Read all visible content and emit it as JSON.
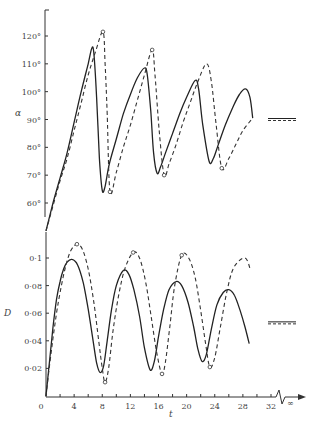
{
  "chart_data": [
    {
      "type": "line",
      "title": "",
      "xlabel": "t",
      "ylabel": "α",
      "ylim": [
        50,
        128
      ],
      "xlim": [
        0,
        32
      ],
      "yticks": [
        60,
        70,
        80,
        90,
        100,
        110,
        120
      ],
      "ytick_labels": [
        "60°",
        "70°",
        "80°",
        "90°",
        "100°",
        "110°",
        "120°"
      ],
      "grid": false,
      "asymptote": {
        "value": 90,
        "label": "t → ∞"
      },
      "series": [
        {
          "name": "solid",
          "style": "solid",
          "points": [
            [
              0,
              50
            ],
            [
              1,
              60
            ],
            [
              2,
              69
            ],
            [
              3,
              78
            ],
            [
              4,
              89
            ],
            [
              5,
              100
            ],
            [
              6,
              110
            ],
            [
              6.5,
              115.5
            ],
            [
              6.8,
              114
            ],
            [
              7.2,
              98
            ],
            [
              7.6,
              76
            ],
            [
              8,
              64.5
            ],
            [
              8.4,
              66
            ],
            [
              9,
              74
            ],
            [
              10,
              83
            ],
            [
              11,
              92
            ],
            [
              12,
              99
            ],
            [
              13,
              105
            ],
            [
              14,
              108.5
            ],
            [
              14.4,
              106
            ],
            [
              14.9,
              93
            ],
            [
              15.3,
              78
            ],
            [
              15.8,
              70.7
            ],
            [
              16.3,
              73
            ],
            [
              17,
              78
            ],
            [
              18,
              85
            ],
            [
              19,
              92
            ],
            [
              20,
              98
            ],
            [
              21.2,
              104
            ],
            [
              21.7,
              101
            ],
            [
              22.3,
              88
            ],
            [
              23.2,
              75
            ],
            [
              23.8,
              76
            ],
            [
              24.5,
              81
            ],
            [
              25.5,
              88
            ],
            [
              26.5,
              94
            ],
            [
              27.5,
              99
            ],
            [
              28.4,
              101
            ],
            [
              29,
              98
            ],
            [
              29.4,
              90.5
            ]
          ]
        },
        {
          "name": "dashed",
          "style": "dashed",
          "points": [
            [
              0,
              50
            ],
            [
              1,
              59
            ],
            [
              2,
              68
            ],
            [
              3,
              76
            ],
            [
              4,
              86
            ],
            [
              5,
              96
            ],
            [
              6,
              106
            ],
            [
              7,
              114
            ],
            [
              8.1,
              121.5
            ],
            [
              8.4,
              110
            ],
            [
              8.7,
              92
            ],
            [
              9.1,
              64
            ],
            [
              10,
              71
            ],
            [
              11,
              80
            ],
            [
              12,
              88
            ],
            [
              13,
              97
            ],
            [
              14,
              106
            ],
            [
              15.1,
              115
            ],
            [
              15.5,
              106
            ],
            [
              16.1,
              86
            ],
            [
              16.8,
              70
            ],
            [
              17.5,
              74
            ],
            [
              18.5,
              81
            ],
            [
              19.5,
              89
            ],
            [
              20.5,
              96
            ],
            [
              21.5,
              103
            ],
            [
              22.8,
              110
            ],
            [
              23.5,
              104
            ],
            [
              24.2,
              88
            ],
            [
              25,
              72.5
            ],
            [
              26,
              76
            ],
            [
              27,
              81
            ],
            [
              28,
              86
            ],
            [
              29.4,
              90.5
            ]
          ]
        }
      ],
      "markers": [
        {
          "series": "dashed",
          "t": 8.1,
          "value": 121.5
        },
        {
          "series": "dashed",
          "t": 9.1,
          "value": 64
        },
        {
          "series": "dashed",
          "t": 15.1,
          "value": 115
        },
        {
          "series": "dashed",
          "t": 16.8,
          "value": 70
        },
        {
          "series": "dashed",
          "t": 25,
          "value": 72.5
        }
      ]
    },
    {
      "type": "line",
      "title": "",
      "xlabel": "t",
      "ylabel": "D",
      "ylim": [
        0,
        0.125
      ],
      "xlim": [
        0,
        32
      ],
      "xticks": [
        0,
        4,
        8,
        12,
        16,
        20,
        24,
        28,
        32
      ],
      "xtick_labels": [
        "0",
        "4",
        "8",
        "12",
        "16",
        "20",
        "24",
        "28",
        "32"
      ],
      "x_break_label": "∞",
      "yticks": [
        0.02,
        0.04,
        0.06,
        0.08,
        0.1
      ],
      "ytick_labels": [
        "0·02",
        "0·04",
        "0·06",
        "0·08",
        "0·1"
      ],
      "grid": false,
      "asymptote": {
        "value": 0.053,
        "label": "t → ∞"
      },
      "series": [
        {
          "name": "solid",
          "style": "solid",
          "points": [
            [
              0,
              0
            ],
            [
              0.5,
              0.025
            ],
            [
              1,
              0.05
            ],
            [
              1.5,
              0.07
            ],
            [
              2,
              0.083
            ],
            [
              2.5,
              0.092
            ],
            [
              3,
              0.097
            ],
            [
              3.7,
              0.099
            ],
            [
              4.5,
              0.095
            ],
            [
              5.3,
              0.082
            ],
            [
              6,
              0.063
            ],
            [
              6.7,
              0.04
            ],
            [
              7.2,
              0.024
            ],
            [
              7.7,
              0.017
            ],
            [
              8.2,
              0.022
            ],
            [
              8.7,
              0.04
            ],
            [
              9.3,
              0.062
            ],
            [
              10,
              0.08
            ],
            [
              11,
              0.091
            ],
            [
              11.8,
              0.088
            ],
            [
              12.5,
              0.077
            ],
            [
              13.3,
              0.058
            ],
            [
              14,
              0.035
            ],
            [
              14.8,
              0.019
            ],
            [
              15.4,
              0.025
            ],
            [
              16,
              0.043
            ],
            [
              16.7,
              0.062
            ],
            [
              17.5,
              0.077
            ],
            [
              18.5,
              0.083
            ],
            [
              19.3,
              0.08
            ],
            [
              20.2,
              0.068
            ],
            [
              21,
              0.05
            ],
            [
              21.6,
              0.034
            ],
            [
              22.2,
              0.025
            ],
            [
              22.8,
              0.03
            ],
            [
              23.5,
              0.048
            ],
            [
              24.3,
              0.066
            ],
            [
              25.2,
              0.075
            ],
            [
              26,
              0.077
            ],
            [
              26.8,
              0.073
            ],
            [
              27.6,
              0.062
            ],
            [
              28.3,
              0.05
            ],
            [
              28.9,
              0.038
            ]
          ]
        },
        {
          "name": "dashed",
          "style": "dashed",
          "points": [
            [
              0,
              0
            ],
            [
              0.5,
              0.022
            ],
            [
              1,
              0.042
            ],
            [
              1.5,
              0.06
            ],
            [
              2,
              0.075
            ],
            [
              2.7,
              0.092
            ],
            [
              3.5,
              0.105
            ],
            [
              4.4,
              0.11
            ],
            [
              5.2,
              0.106
            ],
            [
              6,
              0.092
            ],
            [
              6.8,
              0.068
            ],
            [
              7.5,
              0.04
            ],
            [
              8,
              0.02
            ],
            [
              8.4,
              0.01
            ],
            [
              8.9,
              0.02
            ],
            [
              9.5,
              0.046
            ],
            [
              10.3,
              0.072
            ],
            [
              11.2,
              0.092
            ],
            [
              12.4,
              0.104
            ],
            [
              13.3,
              0.1
            ],
            [
              14.2,
              0.082
            ],
            [
              15,
              0.056
            ],
            [
              15.8,
              0.03
            ],
            [
              16.5,
              0.016
            ],
            [
              17,
              0.025
            ],
            [
              17.6,
              0.05
            ],
            [
              18.3,
              0.08
            ],
            [
              19.3,
              0.102
            ],
            [
              20.3,
              0.1
            ],
            [
              21.2,
              0.086
            ],
            [
              22,
              0.062
            ],
            [
              22.7,
              0.038
            ],
            [
              23.3,
              0.021
            ],
            [
              24,
              0.028
            ],
            [
              24.8,
              0.05
            ],
            [
              25.7,
              0.075
            ],
            [
              26.7,
              0.093
            ],
            [
              28.3,
              0.1
            ],
            [
              29.1,
              0.091
            ]
          ]
        }
      ],
      "markers": [
        {
          "series": "dashed",
          "t": 4.4,
          "value": 0.11
        },
        {
          "series": "dashed",
          "t": 8.4,
          "value": 0.01
        },
        {
          "series": "dashed",
          "t": 12.4,
          "value": 0.104
        },
        {
          "series": "dashed",
          "t": 16.5,
          "value": 0.016
        },
        {
          "series": "dashed",
          "t": 19.3,
          "value": 0.102
        },
        {
          "series": "dashed",
          "t": 23.3,
          "value": 0.021
        }
      ]
    }
  ]
}
